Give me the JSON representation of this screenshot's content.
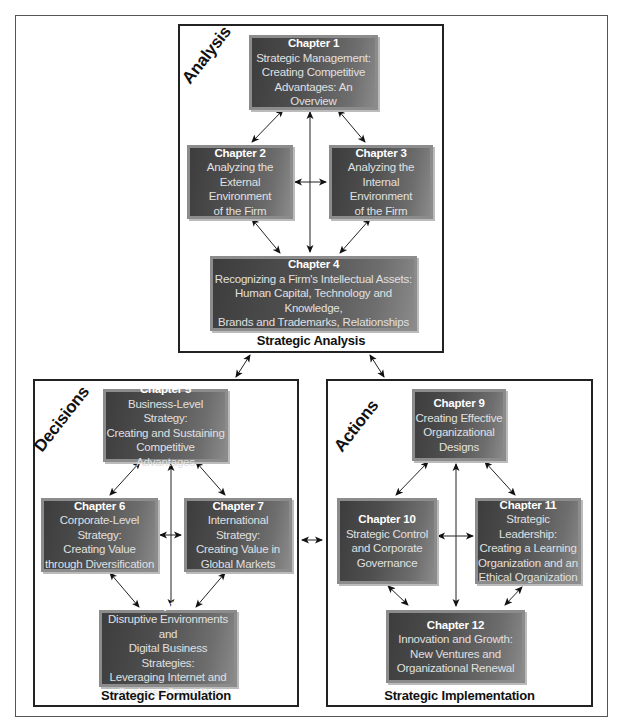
{
  "diagram": {
    "sections": {
      "analysis": {
        "label": "Analysis",
        "caption": "Strategic Analysis",
        "chapters": [
          {
            "chapter": "Chapter 1",
            "title": "Strategic Management:\nCreating Competitive\nAdvantages: An Overview"
          },
          {
            "chapter": "Chapter 2",
            "title": "Analyzing the\nExternal Environment\nof the Firm"
          },
          {
            "chapter": "Chapter 3",
            "title": "Analyzing the\nInternal Environment\nof the Firm"
          },
          {
            "chapter": "Chapter 4",
            "title": "Recognizing a Firm's Intellectual Assets:\nHuman Capital, Technology and Knowledge,\nBrands and Trademarks, Relationships"
          }
        ]
      },
      "decisions": {
        "label": "Decisions",
        "caption": "Strategic Formulation",
        "chapters": [
          {
            "chapter": "Chapter 5",
            "title": "Business-Level Strategy:\nCreating and Sustaining\nCompetitive Advantages"
          },
          {
            "chapter": "Chapter 6",
            "title": "Corporate-Level Strategy:\nCreating Value\nthrough Diversification"
          },
          {
            "chapter": "Chapter 7",
            "title": "International Strategy:\nCreating Value in\nGlobal Markets"
          },
          {
            "chapter": "Chapter 8",
            "title": "Disruptive Environments and\nDigital Business Strategies:\nLeveraging Internet and\neBusiness Capabilities"
          }
        ]
      },
      "actions": {
        "label": "Actions",
        "caption": "Strategic Implementation",
        "chapters": [
          {
            "chapter": "Chapter 9",
            "title": "Creating Effective\nOrganizational\nDesigns"
          },
          {
            "chapter": "Chapter 10",
            "title": "Strategic Control\nand Corporate\nGovernance"
          },
          {
            "chapter": "Chapter 11",
            "title": "Strategic Leadership:\nCreating a Learning\nOrganization and an\nEthical Organization"
          },
          {
            "chapter": "Chapter 12",
            "title": "Innovation and Growth:\nNew Ventures and\nOrganizational Renewal"
          }
        ]
      }
    },
    "colors": {
      "box_dark": "#3d3d3d",
      "box_light": "#8a8a8a",
      "box_border": "#8c8c8c",
      "text": "#ffffff",
      "line": "#222222"
    }
  }
}
